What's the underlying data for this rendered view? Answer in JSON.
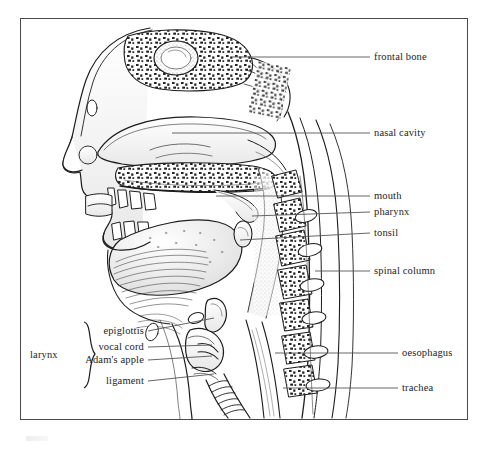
{
  "figure": {
    "type": "anatomical-diagram",
    "frame": {
      "stroke": "#4a4a4a",
      "background": "#ffffff"
    },
    "ink_color": "#1d1d1d",
    "leader_color": "#555555"
  },
  "labels": {
    "frontal_bone": "frontal bone",
    "nasal_cavity": "nasal cavity",
    "mouth": "mouth",
    "pharynx": "pharynx",
    "tonsil": "tonsil",
    "spinal_column": "spinal column",
    "oesophagus": "oesophagus",
    "trachea": "trachea",
    "epiglottis": "epiglottis",
    "vocal_cord": "vocal cord",
    "adams_apple": "Adam's apple",
    "ligament": "ligament",
    "larynx": "larynx"
  },
  "label_groups": {
    "right_column": [
      "frontal bone",
      "nasal cavity",
      "mouth",
      "pharynx",
      "tonsil",
      "spinal column",
      "oesophagus",
      "trachea"
    ],
    "left_column": [
      "epiglottis",
      "vocal cord",
      "Adam's apple",
      "ligament"
    ],
    "bracket_label": "larynx",
    "bracket_members": [
      "epiglottis",
      "vocal cord",
      "Adam's apple",
      "ligament"
    ]
  }
}
